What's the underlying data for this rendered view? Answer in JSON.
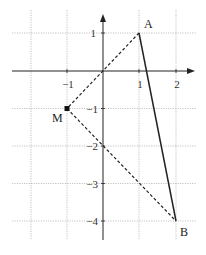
{
  "diagram": {
    "type": "coordinate-plane",
    "axes": {
      "x_ticks": [
        {
          "value": -1,
          "label": "−1"
        },
        {
          "value": 1,
          "label": "1"
        },
        {
          "value": 2,
          "label": "2"
        }
      ],
      "y_ticks": [
        {
          "value": 1,
          "label": "1"
        },
        {
          "value": -1,
          "label": "−1"
        },
        {
          "value": -2,
          "label": "−2"
        },
        {
          "value": -3,
          "label": "−3"
        },
        {
          "value": -4,
          "label": "−4"
        }
      ]
    },
    "points": {
      "A": {
        "label": "A",
        "x": 1,
        "y": 1
      },
      "B": {
        "label": "B",
        "x": 2,
        "y": -4
      },
      "M": {
        "label": "M",
        "x": -1,
        "y": -1
      }
    },
    "segments": [
      {
        "from": "A",
        "to": "B",
        "style": "solid"
      },
      {
        "from": "A",
        "to": "M",
        "style": "dashed"
      },
      {
        "from": "M",
        "to": "B",
        "style": "dashed"
      }
    ]
  }
}
